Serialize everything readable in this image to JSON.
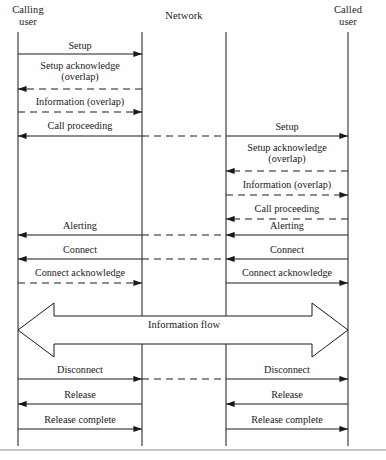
{
  "figure": {
    "type": "sequence-diagram",
    "title": "",
    "background_color": "#ffffff",
    "line_color": "#1a1a1a",
    "footer_rule": true
  },
  "lifelines": [
    {
      "id": "calling-user",
      "label": "Calling\nuser",
      "x": 18,
      "label_x": 18,
      "label_y": 6,
      "top": 32,
      "bottom": 446
    },
    {
      "id": "network-left",
      "label": "",
      "x": 142,
      "top": 32,
      "bottom": 446
    },
    {
      "id": "network-right",
      "label": "",
      "x": 226,
      "top": 32,
      "bottom": 446
    },
    {
      "id": "called-user",
      "label": "Called\nuser",
      "x": 348,
      "label_x": 348,
      "label_y": 6,
      "top": 32,
      "bottom": 446
    }
  ],
  "network": {
    "label": "Network",
    "label_x": 184,
    "label_y": 11
  },
  "messages_left": [
    {
      "label": "Setup",
      "y": 54,
      "dir": "right",
      "style": "solid",
      "label_y": 40,
      "label_x": 80
    },
    {
      "label": "Setup acknowledge\n(overlap)",
      "y": 89,
      "dir": "left",
      "style": "dashed",
      "label_y": 60,
      "label_x": 80
    },
    {
      "label": "Information (overlap)",
      "y": 112,
      "dir": "right",
      "style": "dashed",
      "label_y": 96,
      "label_x": 80
    },
    {
      "label": "Call proceeding",
      "y": 136,
      "dir": "left",
      "style": "solid",
      "label_y": 120,
      "label_x": 80
    },
    {
      "label": "Alerting",
      "y": 235,
      "dir": "left",
      "style": "solid",
      "label_y": 220,
      "label_x": 80
    },
    {
      "label": "Connect",
      "y": 259,
      "dir": "left",
      "style": "solid",
      "label_y": 244,
      "label_x": 80
    },
    {
      "label": "Connect acknowledge",
      "y": 283,
      "dir": "right",
      "style": "dashed",
      "label_y": 267,
      "label_x": 80
    },
    {
      "label": "Disconnect",
      "y": 379,
      "dir": "right",
      "style": "solid",
      "label_y": 364,
      "label_x": 80
    },
    {
      "label": "Release",
      "y": 404,
      "dir": "left",
      "style": "solid",
      "label_y": 389,
      "label_x": 80
    },
    {
      "label": "Release complete",
      "y": 429,
      "dir": "right",
      "style": "solid",
      "label_y": 414,
      "label_x": 80
    }
  ],
  "messages_right": [
    {
      "label": "Setup",
      "y": 136,
      "dir": "right",
      "style": "solid",
      "label_y": 121,
      "label_x": 287
    },
    {
      "label": "Setup acknowledge\n(overlap)",
      "y": 171,
      "dir": "left",
      "style": "dashed",
      "label_y": 142,
      "label_x": 287
    },
    {
      "label": "Information (overlap)",
      "y": 195,
      "dir": "right",
      "style": "dashed",
      "label_y": 179,
      "label_x": 287
    },
    {
      "label": "Call proceeding",
      "y": 219,
      "dir": "left",
      "style": "dashed",
      "label_y": 203,
      "label_x": 287
    },
    {
      "label": "Alerting",
      "y": 235,
      "dir": "left",
      "style": "solid",
      "label_y": 220,
      "label_x": 287
    },
    {
      "label": "Connect",
      "y": 259,
      "dir": "left",
      "style": "solid",
      "label_y": 244,
      "label_x": 287
    },
    {
      "label": "Connect acknowledge",
      "y": 283,
      "dir": "right",
      "style": "solid",
      "label_y": 267,
      "label_x": 287
    },
    {
      "label": "Disconnect",
      "y": 379,
      "dir": "right",
      "style": "solid",
      "label_y": 364,
      "label_x": 287
    },
    {
      "label": "Release",
      "y": 404,
      "dir": "left",
      "style": "solid",
      "label_y": 389,
      "label_x": 287
    },
    {
      "label": "Release complete",
      "y": 429,
      "dir": "right",
      "style": "solid",
      "label_y": 414,
      "label_x": 287
    }
  ],
  "network_links": [
    {
      "y": 136,
      "from": 142,
      "to": 226,
      "style": "dashed"
    },
    {
      "y": 235,
      "from": 142,
      "to": 226,
      "style": "dashed"
    },
    {
      "y": 259,
      "from": 142,
      "to": 226,
      "style": "dashed"
    },
    {
      "y": 379,
      "from": 142,
      "to": 226,
      "style": "dashed"
    }
  ],
  "information_flow": {
    "label": "Information flow",
    "label_x": 184,
    "label_y": 319,
    "left_x": 18,
    "right_x": 348,
    "center_y": 330,
    "shaft_half_height": 14,
    "head_half_height": 27,
    "head_length": 36
  }
}
